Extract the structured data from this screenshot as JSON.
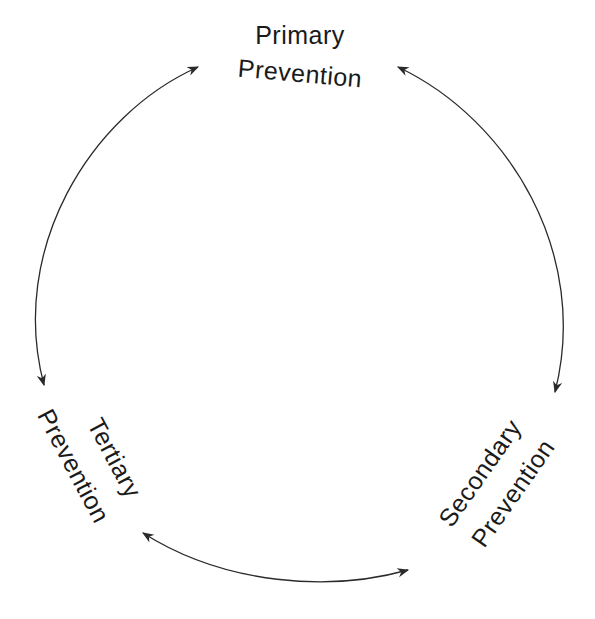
{
  "diagram": {
    "type": "cycle",
    "nodes": [
      {
        "id": "primary",
        "line1": "Primary",
        "line2": "Prevention"
      },
      {
        "id": "secondary",
        "line1": "Secondary",
        "line2": "Prevention"
      },
      {
        "id": "tertiary",
        "line1": "Tertiary",
        "line2": "Prevention"
      }
    ],
    "edges": [
      {
        "from": "primary",
        "to": "secondary",
        "bidirectional": true
      },
      {
        "from": "secondary",
        "to": "tertiary",
        "bidirectional": true
      },
      {
        "from": "tertiary",
        "to": "primary",
        "bidirectional": true
      }
    ],
    "colors": {
      "stroke": "#2a2a2a",
      "text": "#1a1a1a",
      "background": "#ffffff"
    }
  }
}
